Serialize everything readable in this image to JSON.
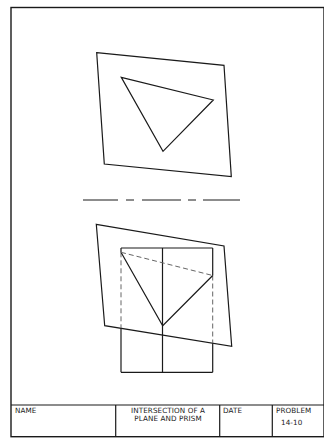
{
  "drawing": {
    "type": "orthographic-projection",
    "line_color": "#1a1a1a",
    "hidden_line_color": "#555555",
    "top_view": {
      "plane": [
        [
          96.7,
          52.7
        ],
        [
          224,
          65.3
        ],
        [
          231.3,
          176.7
        ],
        [
          104.3,
          164
        ]
      ],
      "triangle": [
        [
          121.3,
          77.3
        ],
        [
          213.3,
          100
        ],
        [
          163,
          151.3
        ]
      ]
    },
    "reference_line": {
      "y": 200,
      "segments": [
        [
          83,
          118
        ],
        [
          126,
          134
        ],
        [
          142,
          181
        ],
        [
          188,
          196
        ],
        [
          203,
          240
        ]
      ]
    },
    "front_view": {
      "plane": [
        [
          96.3,
          224.3
        ],
        [
          224,
          246
        ],
        [
          231.7,
          346.3
        ],
        [
          104.7,
          325.7
        ]
      ],
      "prism": {
        "left": 121,
        "right": 212.7,
        "center": 162.5,
        "top": 248,
        "bottom": 372.3
      },
      "triangle": [
        [
          121,
          252.3
        ],
        [
          162.7,
          325.7
        ],
        [
          212.7,
          275.5
        ]
      ],
      "hidden_diagonal": [
        [
          121,
          252.3
        ],
        [
          212.7,
          275.5
        ]
      ]
    }
  },
  "title_block": {
    "name_label": "NAME",
    "title_line1": "INTERSECTION OF A",
    "title_line2": "PLANE AND PRISM",
    "date_label": "DATE",
    "problem_label": "PROBLEM",
    "problem_number": "14-10"
  }
}
